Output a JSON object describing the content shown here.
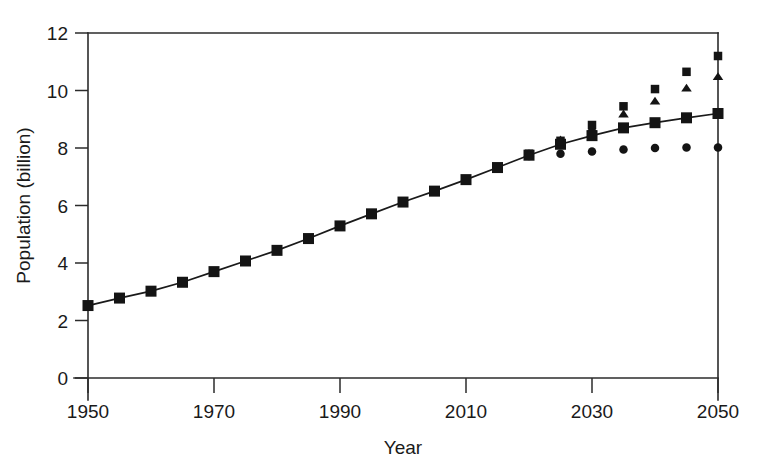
{
  "chart_data": {
    "type": "scatter",
    "title": "",
    "subtitle": "",
    "xlabel": "Year",
    "ylabel": "Population (billion)",
    "xlim": [
      1950,
      2050
    ],
    "ylim": [
      0,
      12
    ],
    "xticks": [
      1950,
      1970,
      1990,
      2010,
      2030,
      2050
    ],
    "yticks": [
      0,
      2,
      4,
      6,
      8,
      10,
      12
    ],
    "xtick_labels": [
      "1950",
      "1970",
      "1990",
      "2010",
      "2030",
      "2050"
    ],
    "ytick_labels": [
      "0",
      "2",
      "4",
      "6",
      "8",
      "10",
      "12"
    ],
    "grid": false,
    "legend": "none",
    "marker_color": "#141414",
    "axis_color": "#2b2b2b",
    "background": "#ffffff",
    "x": [
      1950,
      1955,
      1960,
      1965,
      1970,
      1975,
      1980,
      1985,
      1990,
      1995,
      2000,
      2005,
      2010,
      2015,
      2020,
      2025,
      2030,
      2035,
      2040,
      2045,
      2050
    ],
    "series": [
      {
        "name": "Medium variant (line with squares)",
        "marker": "square",
        "connected": true,
        "values": [
          2.52,
          2.78,
          3.02,
          3.33,
          3.7,
          4.07,
          4.44,
          4.85,
          5.29,
          5.71,
          6.12,
          6.5,
          6.9,
          7.32,
          7.75,
          8.13,
          8.43,
          8.7,
          8.88,
          9.05,
          9.2
        ]
      },
      {
        "name": "High variant (squares)",
        "marker": "square",
        "connected": false,
        "values": [
          null,
          null,
          null,
          null,
          null,
          null,
          null,
          null,
          null,
          null,
          null,
          null,
          null,
          null,
          7.8,
          8.25,
          8.8,
          9.45,
          10.05,
          10.65,
          11.2
        ]
      },
      {
        "name": "Medium-high variant (triangles)",
        "marker": "triangle",
        "connected": false,
        "values": [
          null,
          null,
          null,
          null,
          null,
          null,
          null,
          null,
          null,
          null,
          null,
          null,
          null,
          null,
          7.82,
          8.3,
          8.7,
          9.2,
          9.65,
          10.1,
          10.5
        ]
      },
      {
        "name": "Low variant (circles)",
        "marker": "circle",
        "connected": false,
        "values": [
          null,
          null,
          null,
          null,
          null,
          null,
          null,
          null,
          null,
          null,
          null,
          null,
          null,
          null,
          7.72,
          7.8,
          7.88,
          7.95,
          8.0,
          8.02,
          8.02
        ]
      }
    ]
  }
}
